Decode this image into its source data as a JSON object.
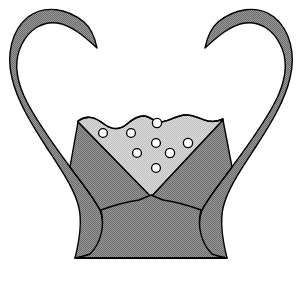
{
  "illustration": {
    "title": "Two-handled chalice containing liquid with bubbles",
    "subject": "chalice-with-liquid",
    "background_color": "#ffffff",
    "canvas": {
      "width": 302,
      "height": 282
    }
  },
  "palette": {
    "background": "#ffffff",
    "vessel_body_fill": "#8a8a8a",
    "vessel_body_dither_light": "#b4b4b4",
    "vessel_body_dither_dark": "#6e6e6e",
    "liquid_fill": "#cccccc",
    "liquid_dither_light": "#dcdcdc",
    "liquid_dither_dark": "#bcbcbc",
    "outline": "#000000",
    "bubble_fill": "#ffffff",
    "bubble_stroke": "#000000"
  },
  "parts": {
    "left_horn": {
      "name": "left-horn-handle",
      "description": "Curved horn-shaped handle sweeping up and curling inward to a point",
      "tip": {
        "x": 97,
        "y": 48
      }
    },
    "right_horn": {
      "name": "right-horn-handle",
      "description": "Mirrored curved horn-shaped handle sweeping up and curling inward to a point",
      "tip": {
        "x": 205,
        "y": 48
      }
    },
    "bowl": {
      "name": "vessel-bowl",
      "description": "V-shaped bowl formed between the two horns"
    },
    "stem": {
      "name": "vessel-stem",
      "description": "Waisted stem narrowing at mid-height"
    },
    "foot": {
      "name": "vessel-foot",
      "description": "Flared foot resting on a flat base line",
      "base_left_x": 75,
      "base_right_x": 222,
      "base_y": 258
    },
    "liquid": {
      "name": "liquid-surface",
      "description": "Pale grey liquid with a wavy surface filling the lower bowl",
      "surface_y": 122,
      "point_y": 196
    }
  },
  "bubbles": [
    {
      "id": "bubble-1",
      "cx": 103,
      "cy": 133,
      "r": 4.4
    },
    {
      "id": "bubble-2",
      "cx": 131,
      "cy": 133,
      "r": 4.4
    },
    {
      "id": "bubble-3",
      "cx": 157,
      "cy": 123,
      "r": 4.6
    },
    {
      "id": "bubble-4",
      "cx": 156,
      "cy": 143,
      "r": 4.4
    },
    {
      "id": "bubble-5",
      "cx": 188,
      "cy": 143,
      "r": 4.6
    },
    {
      "id": "bubble-6",
      "cx": 137,
      "cy": 153,
      "r": 4.4
    },
    {
      "id": "bubble-7",
      "cx": 170,
      "cy": 153,
      "r": 4.6
    },
    {
      "id": "bubble-8",
      "cx": 156,
      "cy": 168,
      "r": 4.4
    }
  ],
  "counts": {
    "bubble_count": 8,
    "handle_count": 2
  }
}
